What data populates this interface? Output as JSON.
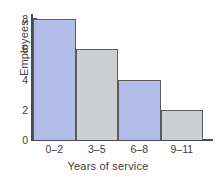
{
  "chart_data": {
    "type": "bar",
    "title": "",
    "subtitle": "",
    "xlabel": "Years of service",
    "ylabel": "Employees",
    "categories": [
      "0–2",
      "3–5",
      "6–8",
      "9–11"
    ],
    "values": [
      8,
      6,
      4,
      2
    ],
    "series": [
      {
        "name": "Employees",
        "values": [
          8,
          6,
          4,
          2
        ]
      }
    ],
    "ylim": [
      0,
      8
    ],
    "xlim": null,
    "ytick_labels": [
      "0",
      "2",
      "4",
      "6",
      "8"
    ],
    "ytick_values": [
      0,
      2,
      4,
      6,
      8
    ],
    "grid": false,
    "legend": false,
    "legend_position": "none",
    "annotations": [],
    "bar_colors": [
      "#b3bce6",
      "#cccfd1",
      "#b3bce6",
      "#cccfd1"
    ],
    "bar_edge_color": "#5a5a5f",
    "axis_color": "#4a4a52",
    "background_color": "#ffffff",
    "text_color": "#3c3c3c",
    "bars_touching": true
  }
}
